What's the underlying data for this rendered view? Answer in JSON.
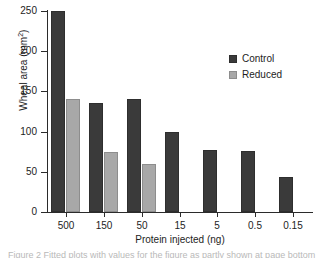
{
  "chart_data": {
    "type": "bar",
    "title": "",
    "xlabel": "Protein injected (ng)",
    "ylabel": "Wheal area (mm²)",
    "ylabel_base": "Wheal area (mm",
    "ylabel_sup": "2",
    "ylabel_tail": ")",
    "categories": [
      "500",
      "150",
      "50",
      "15",
      "5",
      "0.5",
      "0.15"
    ],
    "series": [
      {
        "name": "Control",
        "color": "#3a3a3a",
        "values": [
          250,
          135,
          140,
          100,
          77,
          76,
          43
        ]
      },
      {
        "name": "Reduced",
        "color": "#a8a8a8",
        "values": [
          140,
          75,
          60,
          null,
          null,
          null,
          null
        ]
      }
    ],
    "ylim": [
      0,
      250
    ],
    "yticks": [
      0,
      50,
      100,
      150,
      200,
      250
    ],
    "ytick_labels": [
      "0",
      "50",
      "100",
      "150",
      "200",
      "250"
    ],
    "grid": false,
    "legend_position": "upper right"
  },
  "legend": {
    "entries": [
      {
        "label": "Control",
        "swatch": "control-swatch"
      },
      {
        "label": "Reduced",
        "swatch": "reduced-swatch"
      }
    ]
  },
  "caption": {
    "text": "Figure 2 Fitted plots with values for the figure as partly shown at page bottom"
  }
}
